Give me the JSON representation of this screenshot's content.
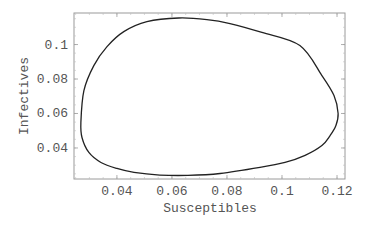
{
  "chart_data": {
    "type": "line",
    "title": "",
    "xlabel": "Susceptibles",
    "ylabel": "Infectives",
    "xlim": [
      0.0244,
      0.1229
    ],
    "ylim": [
      0.022,
      0.1183
    ],
    "grid": false,
    "legend": null,
    "x_ticks": [
      0.04,
      0.06,
      0.08,
      0.1,
      0.12
    ],
    "x_tick_labels": [
      "0.04",
      "0.06",
      "0.08",
      "0.1",
      "0.12"
    ],
    "y_ticks": [
      0.04,
      0.06,
      0.08,
      0.1
    ],
    "y_tick_labels": [
      "0.04",
      "0.06",
      "0.08",
      "0.1"
    ],
    "series": [
      {
        "name": "phase trajectory (closed orbit)",
        "closed": true,
        "x": [
          0.1204,
          0.1189,
          0.1145,
          0.1065,
          0.0927,
          0.0811,
          0.0727,
          0.0625,
          0.0509,
          0.0425,
          0.0364,
          0.0316,
          0.028,
          0.0269,
          0.0273,
          0.0298,
          0.0342,
          0.04,
          0.0462,
          0.0556,
          0.0658,
          0.0775,
          0.092,
          0.1011,
          0.1084,
          0.1145,
          0.1175,
          0.1196
        ],
        "y": [
          0.06,
          0.0704,
          0.082,
          0.0994,
          0.107,
          0.1122,
          0.1145,
          0.1154,
          0.1133,
          0.1075,
          0.0988,
          0.0878,
          0.0733,
          0.0548,
          0.0461,
          0.0374,
          0.0316,
          0.0281,
          0.0258,
          0.0243,
          0.0241,
          0.0252,
          0.0287,
          0.0316,
          0.0357,
          0.0414,
          0.0472,
          0.053
        ]
      }
    ]
  },
  "colors": {
    "curve": "#222222",
    "frame": "#9a9a9a",
    "text": "#555555"
  }
}
